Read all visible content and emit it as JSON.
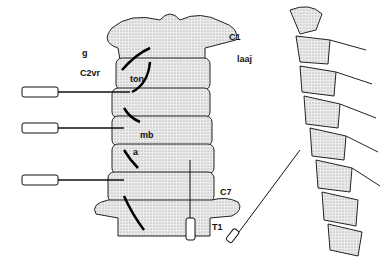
{
  "figure": {
    "labels": {
      "c1": "C1",
      "g": "g",
      "laaj": "laaj",
      "c2vr": "C2vr",
      "ton": "ton",
      "mb": "mb",
      "a": "a",
      "c7": "C7",
      "t1": "T1"
    },
    "colors": {
      "ink": "#111111",
      "bone": "#dcdcdc",
      "background": "#ffffff"
    }
  }
}
